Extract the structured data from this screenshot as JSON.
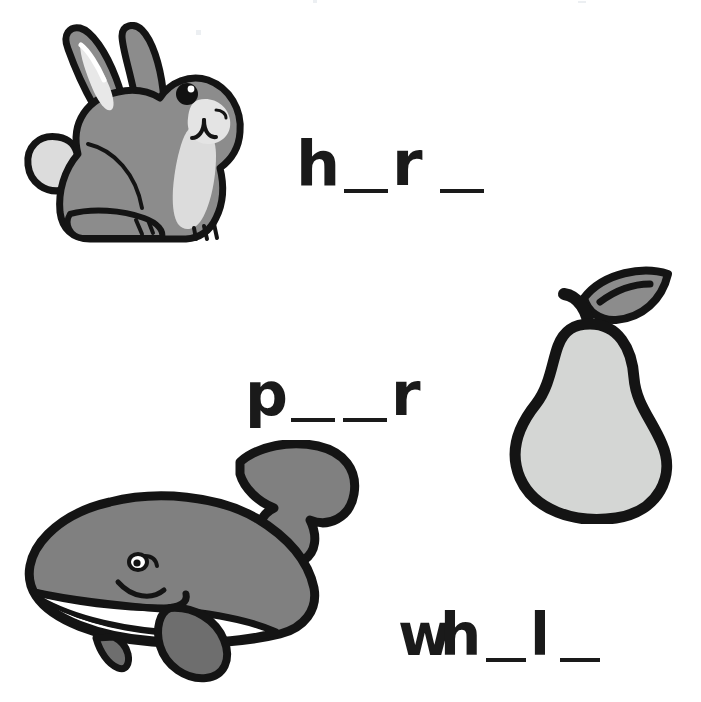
{
  "page": {
    "kind": "phonics-fill-in-the-blank-worksheet",
    "background_color": "#ffffff",
    "width": 701,
    "height": 702
  },
  "palette": {
    "ink": "#1a1a1a",
    "outline": "#141414",
    "rabbit_body": "#8c8c8c",
    "rabbit_light": "#dcdcdc",
    "rabbit_inner_ear": "#d8d8d8",
    "pear_body": "#d4d6d4",
    "pear_leaf": "#8c8c8c",
    "whale_body": "#808080",
    "whale_belly": "#ffffff",
    "whale_fin": "#6e6e6e",
    "eye": "#111111"
  },
  "items": [
    {
      "id": "rabbit",
      "picture_name": "rabbit-illustration",
      "answer": "hare",
      "word_id": "word-hare",
      "tokens": [
        {
          "type": "letter",
          "text": "h"
        },
        {
          "type": "blank",
          "text": " "
        },
        {
          "type": "letter",
          "text": "r"
        },
        {
          "type": "blank",
          "text": " "
        }
      ],
      "display_text": "h _ r _"
    },
    {
      "id": "pear",
      "picture_name": "pear-illustration",
      "answer": "pear",
      "word_id": "word-pear",
      "tokens": [
        {
          "type": "letter",
          "text": "p"
        },
        {
          "type": "blank",
          "text": " "
        },
        {
          "type": "blank",
          "text": " "
        },
        {
          "type": "letter",
          "text": "r"
        }
      ],
      "display_text": "p _ _ r"
    },
    {
      "id": "whale",
      "picture_name": "whale-illustration",
      "answer": "whale",
      "word_id": "word-whale",
      "tokens": [
        {
          "type": "letter",
          "text": "w"
        },
        {
          "type": "letter",
          "text": "h"
        },
        {
          "type": "blank",
          "text": " "
        },
        {
          "type": "letter",
          "text": "l",
          "narrow": true
        },
        {
          "type": "blank",
          "text": " "
        }
      ],
      "display_text": "w h _ l _"
    }
  ]
}
